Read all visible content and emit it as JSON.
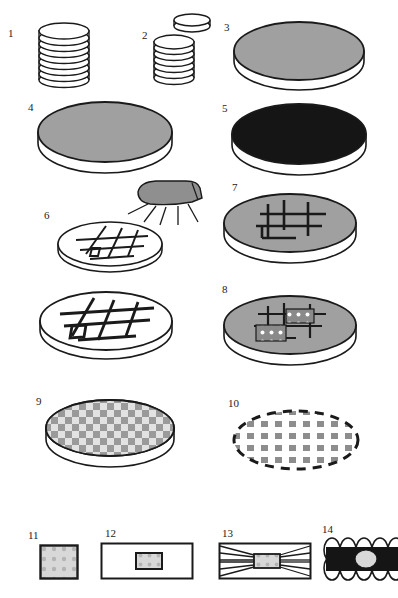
{
  "figure": {
    "width": 396,
    "height": 598,
    "background": "#ffffff",
    "line_color": "#1a1a1a",
    "colors": {
      "disc_gray": "#a0a0a0",
      "disc_black": "#151515",
      "disc_white": "#ffffff",
      "speckle_light": "#d8d8d8",
      "speckle_dot": "#b4b4b4",
      "checker_dark": "#9a9a9a",
      "checker_light": "#e2e2e2",
      "nozzle_gray": "#8f8f8f",
      "outline": "#1a1a1a"
    }
  },
  "steps": [
    {
      "number": "1",
      "label_x": 8,
      "label_y": 28,
      "kind": "disc-stack",
      "description": "stack of thin discs",
      "disc_count": 9,
      "fill": "#ffffff",
      "x": 36,
      "y": 18,
      "w": 52,
      "h": 72
    },
    {
      "number": "2",
      "label_x": 142,
      "label_y": 30,
      "kind": "disc-stack-with-lifted-disc",
      "description": "stack of thin discs with one disc lifted off the top",
      "disc_count": 7,
      "fill": "#ffffff",
      "x": 150,
      "y": 12,
      "w": 58,
      "h": 78
    },
    {
      "number": "3",
      "label_x": 224,
      "label_y": 24,
      "kind": "disc-solid",
      "description": "large gray disc, plan-oblique view",
      "fill": "#a0a0a0",
      "x": 232,
      "y": 18,
      "w": 130,
      "h": 64
    },
    {
      "number": "4",
      "label_x": 28,
      "label_y": 104,
      "kind": "disc-solid",
      "description": "large gray disc, plan-oblique view",
      "fill": "#a0a0a0",
      "x": 36,
      "y": 98,
      "w": 134,
      "h": 68
    },
    {
      "number": "5",
      "label_x": 222,
      "label_y": 105,
      "kind": "disc-solid",
      "description": "large black disc, plan-oblique view",
      "fill": "#151515",
      "x": 230,
      "y": 100,
      "w": 134,
      "h": 68
    },
    {
      "number": "6",
      "label_x": 44,
      "label_y": 212,
      "kind": "disc-grid-sprayed",
      "description": "small white disc with crosshatch grid lines, sprayed by a nozzle above",
      "fill": "#ffffff",
      "x": 56,
      "y": 218,
      "w": 104,
      "h": 52
    },
    {
      "number": "7",
      "label_x": 232,
      "label_y": 184,
      "kind": "disc-grid",
      "description": "gray disc with thick black grid lines",
      "fill": "#a0a0a0",
      "x": 222,
      "y": 190,
      "w": 132,
      "h": 66
    },
    {
      "number": "",
      "label_x": 0,
      "label_y": 0,
      "kind": "disc-grid",
      "description": "unnumbered enlarged white disc with thick black grid lines",
      "fill": "#ffffff",
      "x": 38,
      "y": 288,
      "w": 132,
      "h": 66
    },
    {
      "number": "8",
      "label_x": 222,
      "label_y": 286,
      "kind": "disc-grid-patches",
      "description": "gray disc with grid lines and two speckled rectangular patches",
      "fill": "#a0a0a0",
      "x": 222,
      "y": 292,
      "w": 132,
      "h": 66
    },
    {
      "number": "9",
      "label_x": 36,
      "label_y": 398,
      "kind": "disc-checker",
      "description": "disc fully covered with a checkerboard pattern",
      "fill": "#e2e2e2",
      "x": 44,
      "y": 396,
      "w": 130,
      "h": 66
    },
    {
      "number": "10",
      "label_x": 228,
      "label_y": 400,
      "kind": "dashed-ellipse-array",
      "description": "dashed outline ellipse containing an array of separated gray squares",
      "fill": "#ffffff",
      "x": 230,
      "y": 406,
      "w": 128,
      "h": 66
    },
    {
      "number": "11",
      "label_x": 28,
      "label_y": 534,
      "kind": "speckled-square",
      "description": "single speckled square element",
      "fill": "#d8d8d8",
      "x": 39,
      "y": 544,
      "w": 38,
      "h": 34
    },
    {
      "number": "12",
      "label_x": 105,
      "label_y": 532,
      "kind": "speckled-square-in-rect",
      "description": "speckled square embedded inside a wide rectangle",
      "fill": "#d8d8d8",
      "x": 100,
      "y": 542,
      "w": 92,
      "h": 36
    },
    {
      "number": "13",
      "label_x": 222,
      "label_y": 532,
      "kind": "converging-lines-block",
      "description": "rectangle with converging lines focused on a central gray block",
      "fill": "#d8d8d8",
      "x": 218,
      "y": 542,
      "w": 92,
      "h": 36
    },
    {
      "number": "14",
      "label_x": 322,
      "label_y": 528,
      "kind": "scalloped-black-bar",
      "description": "black bar with scalloped top and bottom edges and a light ellipse at center",
      "fill": "#151515",
      "x": 326,
      "y": 536,
      "w": 70,
      "h": 44
    }
  ]
}
